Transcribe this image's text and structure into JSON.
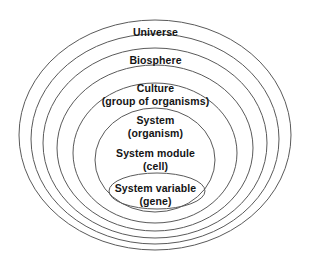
{
  "diagram": {
    "type": "nested-ellipse-hierarchy",
    "background_color": "#ffffff",
    "stroke_color": "#5a5a5a",
    "text_color": "#141414",
    "levels": [
      {
        "index": 0,
        "primary": "Universe",
        "secondary": "",
        "label_y": 26,
        "ellipse": {
          "cx": 155,
          "cy": 135,
          "rx": 136,
          "ry": 115
        }
      },
      {
        "index": 1,
        "primary": "Biosphere",
        "secondary": "",
        "label_y": 54,
        "ellipse": {
          "cx": 155,
          "cy": 139,
          "rx": 124,
          "ry": 105
        }
      },
      {
        "index": 2,
        "primary": "Culture",
        "secondary": "(group of organisms)",
        "label_y": 82,
        "ellipse": {
          "cx": 155,
          "cy": 143,
          "rx": 112,
          "ry": 95
        }
      },
      {
        "index": 3,
        "primary": "System",
        "secondary": "(organism)",
        "label_y": 114,
        "ellipse": {
          "cx": 155,
          "cy": 148,
          "rx": 98,
          "ry": 83
        }
      },
      {
        "index": 4,
        "primary": "System module",
        "secondary": "(cell)",
        "label_y": 147,
        "ellipse": {
          "cx": 155,
          "cy": 153,
          "rx": 82,
          "ry": 70
        }
      },
      {
        "index": 5,
        "primary": "System variable",
        "secondary": "(gene)",
        "label_y": 182,
        "ellipse": {
          "cx": 155,
          "cy": 160,
          "rx": 60,
          "ry": 52
        }
      },
      {
        "index": 6,
        "primary": "",
        "secondary": "",
        "label_y": 0,
        "ellipse": {
          "cx": 157,
          "cy": 191,
          "rx": 48,
          "ry": 18
        }
      }
    ]
  }
}
